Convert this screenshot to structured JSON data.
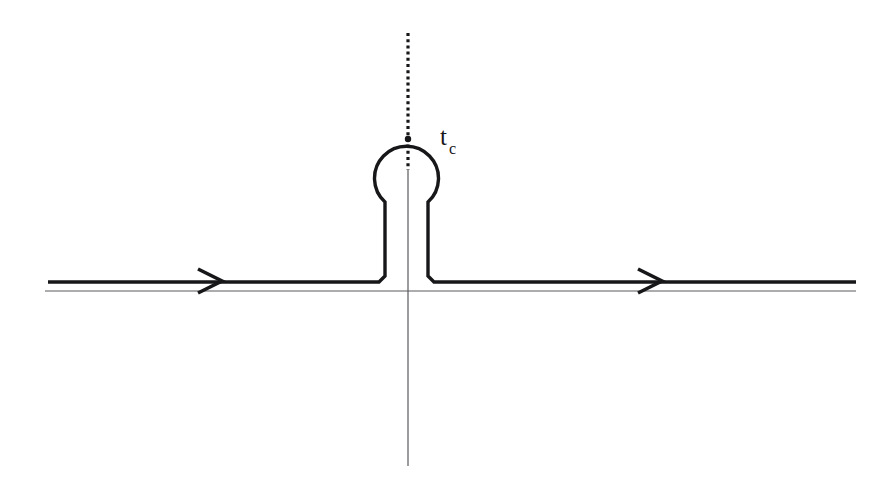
{
  "figure": {
    "background_color": "#ffffff",
    "ink_color": "#17171a",
    "axis_color": "#5a5a5e",
    "width": 892,
    "height": 499,
    "labels": {
      "branch_point": {
        "base": "t",
        "subscript": "c",
        "full": "t_c",
        "x": 443,
        "y": 130
      }
    },
    "elements": {
      "real_axis": {
        "name": "real-axis-line",
        "x_start": 45,
        "x_end": 856,
        "y": 291,
        "stroke_width": 1.1
      },
      "imaginary_axis": {
        "name": "imaginary-axis-line",
        "x": 408,
        "y_start": 172,
        "y_end": 466,
        "stroke_width": 1.1
      },
      "branch_cut": {
        "name": "branch-cut-dotted-line",
        "x": 408,
        "y_start": 33,
        "y_end": 170,
        "style": "dotted",
        "dot_size": 3,
        "dot_gap": 3
      },
      "contour_left_segment": {
        "name": "contour-left-segment",
        "x_start": 48,
        "x_end": 385,
        "y": 282
      },
      "contour_right_segment": {
        "name": "contour-right-segment",
        "x_start": 428,
        "x_end": 856,
        "y": 282
      },
      "contour_left_riser": {
        "name": "contour-left-riser",
        "x": 385,
        "y_start": 282,
        "y_end": 196
      },
      "contour_right_riser": {
        "name": "contour-right-riser",
        "x": 428,
        "y_start": 282,
        "y_end": 196
      },
      "contour_circle": {
        "name": "contour-circle-around-branch-point",
        "center_x": 408,
        "center_y": 170,
        "radius": 32,
        "opening": "bottom"
      },
      "arrow_left": {
        "name": "arrow-head-left-segment",
        "x": 212,
        "y": 281,
        "direction": "right"
      },
      "arrow_right": {
        "name": "arrow-head-right-segment",
        "x": 652,
        "y": 281,
        "direction": "right"
      },
      "branch_point_marker": {
        "name": "branch-point-marker",
        "x": 408,
        "y": 139
      }
    }
  }
}
